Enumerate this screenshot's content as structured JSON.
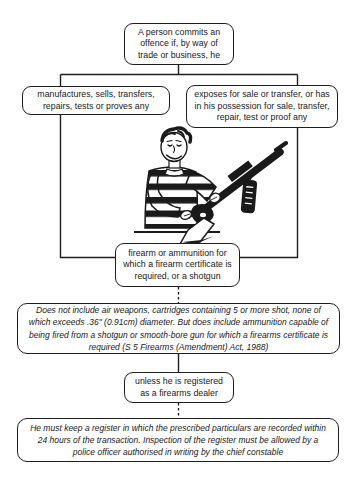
{
  "diagram": {
    "start": "A person commits an offence if, by way of trade or business, he",
    "branch_left": "manufactures, sells, transfers, repairs, tests or proves any",
    "branch_right": "exposes for sale or transfer, or has in his possession for sale, transfer, repair, test or proof any",
    "object": "firearm or ammunition for which a firearm certificate is required, or a shotgun",
    "definition_note": "Does not include air weapons, cartridges containing 5 or more shot, none of which exceeds .36\" (0.91cm) diameter. But does include ammunition capable of being fired from a shotgun or smooth-bore gun for which a firearms certificate is required (S 5 Firearms (Amendment) Act, 1988)",
    "exception": "unless he is registered as a firearms dealer",
    "register_note": "He must keep a register in which the prescribed particulars are recorded within 24 hours of the transaction. Inspection of the register must be allowed by a police officer authorised in writing by the chief constable"
  },
  "illustration": "man-in-striped-sweater-holding-rifle-with-price-tag",
  "colors": {
    "line": "#1f1f1f",
    "background": "#ffffff"
  }
}
